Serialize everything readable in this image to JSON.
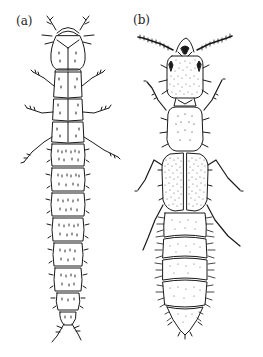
{
  "figure": {
    "panels": [
      {
        "label": "(a)",
        "subject": "larva"
      },
      {
        "label": "(b)",
        "subject": "adult beetle"
      }
    ]
  },
  "colors": {
    "ink": "#1a1a1a",
    "background": "#ffffff"
  }
}
